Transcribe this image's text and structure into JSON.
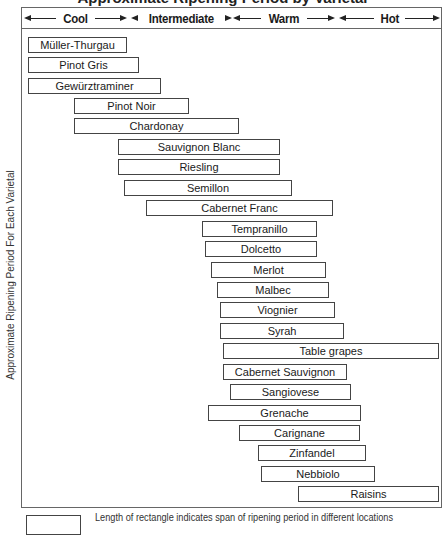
{
  "title": "Approximate Ripening Period by Varietal",
  "y_axis_label": "Approximate Ripening Period For Each Varietal",
  "legend_text": "Length of rectangle indicates span of ripening period in different locations",
  "zones": [
    {
      "label": "Cool",
      "x0": 0,
      "x1": 107
    },
    {
      "label": "Intermediate",
      "x0": 107,
      "x1": 209
    },
    {
      "label": "Warm",
      "x0": 209,
      "x1": 315
    },
    {
      "label": "Hot",
      "x0": 315,
      "x1": 420
    }
  ],
  "chart_data": {
    "type": "bar",
    "subtype": "floating-horizontal-range",
    "title": "Approximate Ripening Period by Varietal",
    "xlabel": "Climate zone",
    "ylabel": "Approximate Ripening Period For Each Varietal",
    "x_categories": [
      "Cool",
      "Intermediate",
      "Warm",
      "Hot"
    ],
    "x_scale_note": "0 = start of Cool, 4 = end of Hot; each zone spans 1 unit",
    "legend": "Length of rectangle indicates span of ripening period in different locations",
    "grid": false,
    "bars": [
      {
        "label": "Müller-Thurgau",
        "start": 0.06,
        "end": 1.0,
        "px": [
          28,
          127
        ],
        "y": 37
      },
      {
        "label": "Pinot Gris",
        "start": 0.06,
        "end": 1.11,
        "px": [
          28,
          139
        ],
        "y": 57
      },
      {
        "label": "Gewürztraminer",
        "start": 0.06,
        "end": 1.32,
        "px": [
          28,
          161
        ],
        "y": 78
      },
      {
        "label": "Pinot Noir",
        "start": 0.5,
        "end": 1.59,
        "px": [
          74,
          189
        ],
        "y": 98
      },
      {
        "label": "Chardonay",
        "start": 0.5,
        "end": 2.06,
        "px": [
          74,
          239
        ],
        "y": 118
      },
      {
        "label": "Sauvignon Blanc",
        "start": 0.91,
        "end": 2.45,
        "px": [
          118,
          280
        ],
        "y": 139
      },
      {
        "label": "Riesling",
        "start": 0.91,
        "end": 2.45,
        "px": [
          118,
          280
        ],
        "y": 159
      },
      {
        "label": "Semillon",
        "start": 0.97,
        "end": 2.57,
        "px": [
          124,
          292
        ],
        "y": 180
      },
      {
        "label": "Cabernet Franc",
        "start": 1.18,
        "end": 2.96,
        "px": [
          146,
          333
        ],
        "y": 200
      },
      {
        "label": "Tempranillo",
        "start": 1.71,
        "end": 2.8,
        "px": [
          202,
          317
        ],
        "y": 221
      },
      {
        "label": "Dolcetto",
        "start": 1.74,
        "end": 2.8,
        "px": [
          205,
          317
        ],
        "y": 241
      },
      {
        "label": "Merlot",
        "start": 1.79,
        "end": 2.89,
        "px": [
          211,
          326
        ],
        "y": 262
      },
      {
        "label": "Malbec",
        "start": 1.85,
        "end": 2.91,
        "px": [
          217,
          329
        ],
        "y": 282
      },
      {
        "label": "Viognier",
        "start": 1.88,
        "end": 2.97,
        "px": [
          220,
          335
        ],
        "y": 302
      },
      {
        "label": "Syrah",
        "start": 1.88,
        "end": 3.06,
        "px": [
          220,
          344
        ],
        "y": 323
      },
      {
        "label": "Table grapes",
        "start": 1.91,
        "end": 3.96,
        "px": [
          223,
          439
        ],
        "y": 343
      },
      {
        "label": "Cabernet Sauvignon",
        "start": 1.91,
        "end": 3.09,
        "px": [
          223,
          347
        ],
        "y": 364
      },
      {
        "label": "Sangiovese",
        "start": 1.97,
        "end": 3.12,
        "px": [
          230,
          351
        ],
        "y": 384
      },
      {
        "label": "Grenache",
        "start": 1.77,
        "end": 3.22,
        "px": [
          208,
          361
        ],
        "y": 405
      },
      {
        "label": "Carignane",
        "start": 2.06,
        "end": 3.21,
        "px": [
          239,
          360
        ],
        "y": 425
      },
      {
        "label": "Zinfandel",
        "start": 2.24,
        "end": 3.27,
        "px": [
          258,
          366
        ],
        "y": 445
      },
      {
        "label": "Nebbiolo",
        "start": 2.27,
        "end": 3.35,
        "px": [
          261,
          375
        ],
        "y": 466
      },
      {
        "label": "Raisins",
        "start": 2.62,
        "end": 3.96,
        "px": [
          298,
          439
        ],
        "y": 486
      }
    ]
  }
}
